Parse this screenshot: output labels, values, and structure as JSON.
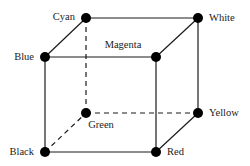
{
  "diagram": {
    "vertices": {
      "cyan": {
        "label": "Cyan",
        "x": 86,
        "y": 18
      },
      "white": {
        "label": "White",
        "x": 198,
        "y": 18
      },
      "blue": {
        "label": "Blue",
        "x": 45,
        "y": 57
      },
      "magenta": {
        "label": "Magenta",
        "x": 156,
        "y": 57
      },
      "green": {
        "label": "Green",
        "x": 86,
        "y": 113
      },
      "yellow": {
        "label": "Yellow",
        "x": 198,
        "y": 113
      },
      "black": {
        "label": "Black",
        "x": 45,
        "y": 152
      },
      "red": {
        "label": "Red",
        "x": 156,
        "y": 152
      }
    },
    "edges": [
      {
        "from": "cyan",
        "to": "white",
        "style": "solid"
      },
      {
        "from": "blue",
        "to": "magenta",
        "style": "solid"
      },
      {
        "from": "black",
        "to": "red",
        "style": "solid"
      },
      {
        "from": "green",
        "to": "yellow",
        "style": "dashed"
      },
      {
        "from": "blue",
        "to": "black",
        "style": "solid"
      },
      {
        "from": "magenta",
        "to": "red",
        "style": "solid"
      },
      {
        "from": "white",
        "to": "yellow",
        "style": "solid"
      },
      {
        "from": "cyan",
        "to": "green",
        "style": "dashed"
      },
      {
        "from": "blue",
        "to": "cyan",
        "style": "solid"
      },
      {
        "from": "magenta",
        "to": "white",
        "style": "solid"
      },
      {
        "from": "red",
        "to": "yellow",
        "style": "solid"
      },
      {
        "from": "black",
        "to": "green",
        "style": "dashed"
      }
    ],
    "colors": {
      "line": "#1a1a1a",
      "vertex": "#000000",
      "text": "#222222",
      "background": "#ffffff"
    }
  }
}
